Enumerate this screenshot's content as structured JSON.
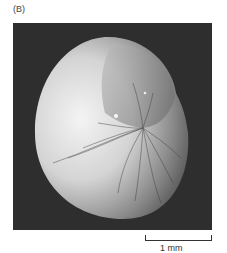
{
  "figure": {
    "panel_label": "(B)",
    "image_description": "scanning electron micrograph of a rounded, coiled specimen with radial wrinkles",
    "scale_bar": {
      "label": "1 mm"
    },
    "colors": {
      "background": "#2e2e2e",
      "specimen_light": "#f0f0f0",
      "specimen_dark": "#6a6a6a"
    }
  }
}
